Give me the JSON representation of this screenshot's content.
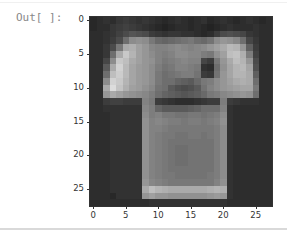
{
  "cell": {
    "prompt": "Out[ ]:"
  },
  "chart_data": {
    "type": "heatmap",
    "title": "",
    "xlabel": "",
    "ylabel": "",
    "colormap": "gray",
    "xlim": [
      -0.5,
      27.5
    ],
    "ylim": [
      27.5,
      -0.5
    ],
    "xticks": [
      0,
      5,
      10,
      15,
      20,
      25
    ],
    "yticks": [
      0,
      5,
      10,
      15,
      20,
      25
    ],
    "shape": [
      28,
      28
    ],
    "values": [
      [
        40,
        45,
        50,
        45,
        55,
        60,
        55,
        50,
        55,
        50,
        45,
        40,
        45,
        50,
        45,
        40,
        45,
        50,
        40,
        45,
        50,
        45,
        40,
        45,
        50,
        45,
        40,
        45
      ],
      [
        40,
        45,
        45,
        55,
        60,
        65,
        60,
        55,
        50,
        45,
        40,
        35,
        40,
        45,
        45,
        40,
        45,
        40,
        35,
        40,
        45,
        50,
        45,
        45,
        45,
        50,
        45,
        45
      ],
      [
        45,
        45,
        50,
        55,
        65,
        75,
        85,
        80,
        75,
        60,
        55,
        50,
        55,
        55,
        50,
        50,
        45,
        40,
        45,
        60,
        75,
        80,
        75,
        70,
        55,
        50,
        45,
        45
      ],
      [
        45,
        45,
        50,
        60,
        75,
        110,
        140,
        145,
        140,
        120,
        105,
        100,
        105,
        110,
        115,
        120,
        110,
        105,
        115,
        140,
        150,
        145,
        135,
        110,
        70,
        55,
        45,
        45
      ],
      [
        45,
        45,
        55,
        75,
        120,
        170,
        175,
        160,
        150,
        135,
        130,
        130,
        135,
        140,
        135,
        130,
        135,
        140,
        150,
        160,
        170,
        185,
        180,
        150,
        95,
        60,
        45,
        45
      ],
      [
        45,
        45,
        55,
        110,
        170,
        200,
        180,
        160,
        150,
        140,
        130,
        125,
        130,
        140,
        140,
        135,
        135,
        125,
        120,
        145,
        160,
        190,
        195,
        175,
        125,
        65,
        45,
        45
      ],
      [
        45,
        45,
        70,
        140,
        200,
        190,
        170,
        160,
        150,
        145,
        130,
        120,
        125,
        130,
        135,
        130,
        130,
        70,
        60,
        120,
        150,
        170,
        190,
        180,
        150,
        75,
        45,
        45
      ],
      [
        45,
        45,
        90,
        170,
        210,
        185,
        165,
        155,
        150,
        140,
        125,
        115,
        120,
        130,
        130,
        125,
        120,
        50,
        45,
        110,
        145,
        165,
        180,
        185,
        165,
        80,
        45,
        45
      ],
      [
        45,
        45,
        110,
        190,
        205,
        185,
        165,
        155,
        150,
        140,
        120,
        110,
        115,
        120,
        125,
        125,
        115,
        60,
        55,
        115,
        150,
        165,
        180,
        180,
        170,
        95,
        45,
        45
      ],
      [
        45,
        45,
        140,
        210,
        200,
        180,
        165,
        155,
        150,
        140,
        120,
        110,
        110,
        100,
        95,
        90,
        105,
        120,
        125,
        140,
        150,
        160,
        170,
        175,
        170,
        110,
        45,
        45
      ],
      [
        45,
        45,
        170,
        220,
        195,
        175,
        160,
        155,
        145,
        135,
        115,
        110,
        90,
        80,
        75,
        80,
        90,
        115,
        130,
        140,
        150,
        155,
        160,
        165,
        165,
        120,
        45,
        45
      ],
      [
        45,
        45,
        150,
        170,
        160,
        150,
        145,
        140,
        135,
        125,
        110,
        100,
        95,
        90,
        85,
        90,
        95,
        105,
        120,
        125,
        135,
        140,
        145,
        150,
        145,
        110,
        45,
        45
      ],
      [
        45,
        45,
        60,
        65,
        65,
        60,
        60,
        60,
        130,
        120,
        60,
        55,
        50,
        45,
        45,
        45,
        50,
        55,
        60,
        60,
        125,
        60,
        55,
        50,
        50,
        50,
        45,
        45
      ],
      [
        45,
        45,
        50,
        50,
        50,
        50,
        50,
        50,
        135,
        125,
        100,
        90,
        90,
        90,
        90,
        95,
        100,
        110,
        110,
        110,
        130,
        50,
        45,
        45,
        45,
        45,
        45,
        45
      ],
      [
        45,
        45,
        45,
        50,
        50,
        50,
        50,
        50,
        140,
        125,
        130,
        120,
        120,
        115,
        115,
        120,
        120,
        115,
        120,
        125,
        140,
        50,
        45,
        45,
        45,
        45,
        45,
        45
      ],
      [
        45,
        45,
        45,
        50,
        50,
        50,
        50,
        50,
        145,
        130,
        135,
        130,
        125,
        125,
        120,
        125,
        125,
        120,
        125,
        130,
        145,
        50,
        45,
        45,
        45,
        45,
        45,
        45
      ],
      [
        45,
        45,
        45,
        50,
        50,
        50,
        50,
        50,
        145,
        130,
        130,
        125,
        120,
        120,
        120,
        120,
        120,
        120,
        120,
        125,
        140,
        50,
        45,
        45,
        45,
        45,
        45,
        45
      ],
      [
        45,
        45,
        45,
        50,
        50,
        50,
        50,
        50,
        145,
        130,
        125,
        120,
        120,
        115,
        115,
        120,
        120,
        115,
        120,
        125,
        140,
        50,
        45,
        45,
        45,
        45,
        45,
        45
      ],
      [
        45,
        45,
        45,
        50,
        50,
        50,
        50,
        50,
        145,
        130,
        125,
        120,
        115,
        115,
        115,
        115,
        115,
        115,
        115,
        125,
        140,
        50,
        45,
        45,
        45,
        45,
        45,
        45
      ],
      [
        45,
        45,
        45,
        50,
        50,
        50,
        50,
        50,
        145,
        130,
        125,
        120,
        115,
        110,
        110,
        115,
        115,
        115,
        115,
        125,
        140,
        50,
        45,
        45,
        45,
        45,
        45,
        45
      ],
      [
        45,
        45,
        45,
        50,
        50,
        50,
        50,
        50,
        145,
        130,
        125,
        120,
        115,
        110,
        110,
        115,
        115,
        115,
        115,
        125,
        140,
        50,
        45,
        45,
        45,
        45,
        45,
        45
      ],
      [
        45,
        45,
        45,
        50,
        50,
        50,
        50,
        50,
        145,
        130,
        125,
        120,
        115,
        110,
        110,
        115,
        115,
        115,
        115,
        125,
        140,
        50,
        45,
        45,
        45,
        45,
        45,
        45
      ],
      [
        45,
        45,
        45,
        50,
        50,
        50,
        50,
        50,
        145,
        130,
        125,
        120,
        115,
        115,
        115,
        115,
        115,
        115,
        115,
        125,
        140,
        50,
        45,
        45,
        45,
        45,
        45,
        45
      ],
      [
        45,
        45,
        45,
        50,
        50,
        50,
        50,
        50,
        145,
        130,
        125,
        120,
        120,
        115,
        115,
        115,
        115,
        115,
        120,
        125,
        140,
        50,
        45,
        45,
        45,
        45,
        45,
        45
      ],
      [
        45,
        45,
        45,
        50,
        50,
        50,
        50,
        50,
        150,
        135,
        130,
        125,
        120,
        120,
        120,
        120,
        120,
        120,
        120,
        130,
        145,
        50,
        45,
        45,
        45,
        45,
        45,
        45
      ],
      [
        45,
        45,
        45,
        50,
        50,
        50,
        50,
        50,
        170,
        190,
        180,
        175,
        170,
        170,
        170,
        170,
        170,
        170,
        175,
        180,
        175,
        50,
        45,
        45,
        45,
        45,
        45,
        45
      ],
      [
        45,
        45,
        45,
        40,
        50,
        50,
        50,
        50,
        150,
        160,
        150,
        150,
        145,
        145,
        145,
        145,
        145,
        145,
        150,
        155,
        150,
        50,
        45,
        45,
        45,
        45,
        45,
        45
      ],
      [
        45,
        45,
        45,
        45,
        45,
        45,
        45,
        45,
        45,
        50,
        50,
        50,
        50,
        50,
        50,
        50,
        50,
        50,
        50,
        50,
        50,
        45,
        45,
        45,
        45,
        45,
        45,
        45
      ]
    ]
  }
}
